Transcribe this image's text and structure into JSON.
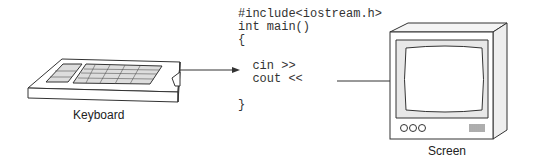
{
  "diagram": {
    "code_lines": [
      "#include<iostream.h>",
      "int main()",
      "{",
      "",
      "  cin >>",
      "  cout <<",
      "",
      "}"
    ],
    "keyboard_label": "Keyboard",
    "screen_label": "Screen",
    "arrows": [
      {
        "from": "keyboard",
        "to": "cin"
      },
      {
        "from": "cout",
        "to": "screen"
      }
    ]
  }
}
